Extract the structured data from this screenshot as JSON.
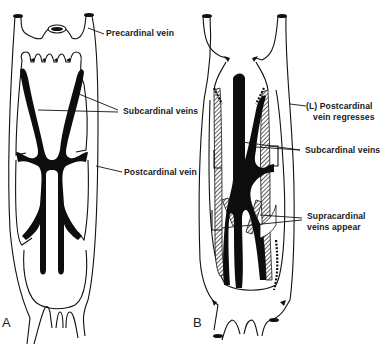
{
  "figure": {
    "panels": [
      {
        "letter": "A",
        "labels": {
          "precardinal": "Precardinal vein",
          "subcardinal": "Subcardinal veins",
          "postcardinal": "Postcardinal vein"
        }
      },
      {
        "letter": "B",
        "labels": {
          "postcardinal_regresses_line1": "(L) Postcardinal",
          "postcardinal_regresses_line2": "vein regresses",
          "subcardinal": "Subcardinal veins",
          "supracardinal_line1": "Supracardinal",
          "supracardinal_line2": "veins appear"
        }
      }
    ],
    "colors": {
      "background": "#ffffff",
      "ink": "#111111"
    }
  }
}
